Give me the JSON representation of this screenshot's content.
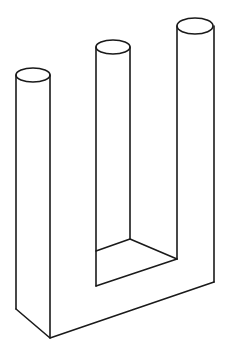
{
  "figure": {
    "title": "",
    "stroke_color": "#1a1a1a",
    "background": "#ffffff",
    "prongs": [
      {
        "name": "left",
        "top_cx": 33,
        "top_cy": 75,
        "rx": 17,
        "ry": 7
      },
      {
        "name": "middle",
        "top_cx": 113,
        "top_cy": 47,
        "rx": 17,
        "ry": 7
      },
      {
        "name": "right",
        "top_cx": 195,
        "top_cy": 26,
        "rx": 18,
        "ry": 8
      }
    ]
  }
}
